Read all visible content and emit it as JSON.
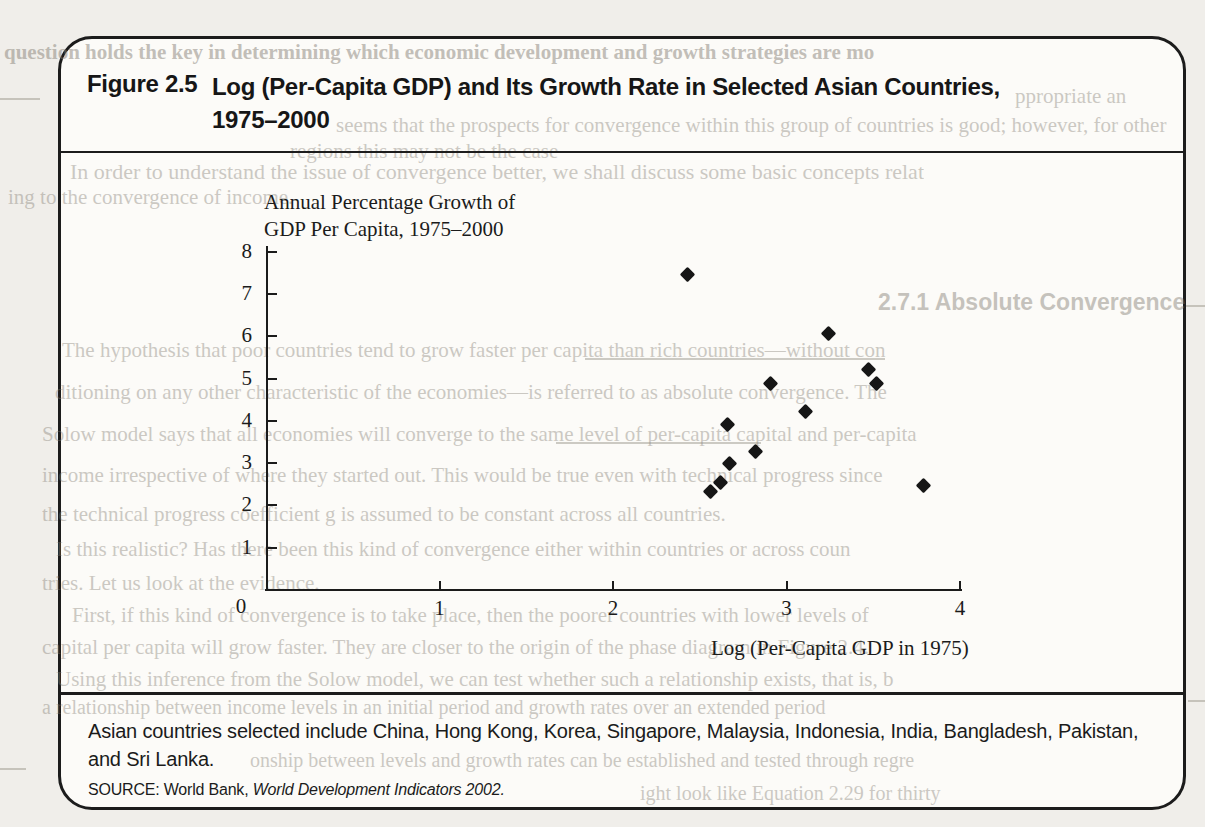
{
  "figure": {
    "label": "Figure 2.5",
    "title_line1": "Log (Per-Capita GDP) and Its Growth Rate in Selected Asian Countries,",
    "title_line2": "1975–2000",
    "caption_line1": "Asian countries selected include China, Hong Kong, Korea, Singapore, Malaysia, Indonesia, India, Bangladesh, Pakistan,",
    "caption_line2": "and Sri Lanka.",
    "source_prefix": "SOURCE: World Bank, ",
    "source_italic": "World Development Indicators 2002."
  },
  "chart_data": {
    "type": "scatter",
    "ylabel_line1": "Annual Percentage Growth of",
    "ylabel_line2": "GDP Per Capita, 1975–2000",
    "xlabel": "Log (Per-Capita GDP in 1975)",
    "xlim": [
      0,
      4
    ],
    "ylim": [
      0,
      8
    ],
    "x_ticks": [
      1,
      2,
      3,
      4
    ],
    "y_ticks": [
      1,
      2,
      3,
      4,
      5,
      6,
      7,
      8
    ],
    "origin_label": "0",
    "grid": false,
    "marker": "diamond",
    "marker_color": "#161616",
    "points": [
      {
        "x": 2.43,
        "y": 7.46
      },
      {
        "x": 3.24,
        "y": 6.07
      },
      {
        "x": 3.47,
        "y": 5.22
      },
      {
        "x": 3.52,
        "y": 4.87
      },
      {
        "x": 2.91,
        "y": 4.89
      },
      {
        "x": 3.11,
        "y": 4.23
      },
      {
        "x": 2.66,
        "y": 3.92
      },
      {
        "x": 2.82,
        "y": 3.27
      },
      {
        "x": 2.67,
        "y": 3.0
      },
      {
        "x": 2.62,
        "y": 2.55
      },
      {
        "x": 2.56,
        "y": 2.34
      },
      {
        "x": 3.79,
        "y": 2.46
      }
    ]
  },
  "bleedthrough": {
    "lines": [
      {
        "cls": "serif-b",
        "x": 4,
        "y": 40,
        "size": 21,
        "text": "question holds the key in determining which economic development and growth strategies are mo"
      },
      {
        "cls": "serif",
        "x": 1015,
        "y": 84,
        "size": 21,
        "text": "ppropriate an"
      },
      {
        "cls": "serif",
        "x": 336,
        "y": 113,
        "size": 21,
        "text": "seems that the prospects for convergence within this group of countries is good; however, for other"
      },
      {
        "cls": "serif",
        "x": 290,
        "y": 139,
        "size": 21,
        "text": "regions this may not be the case"
      },
      {
        "cls": "serif",
        "x": 70,
        "y": 159,
        "size": 22,
        "text": "In order to understand the issue of convergence better, we shall discuss some basic concepts relat"
      },
      {
        "cls": "serif",
        "x": 8,
        "y": 185,
        "size": 21,
        "text": "ing to the convergence of income."
      },
      {
        "cls": "sans-b",
        "x": 878,
        "y": 289,
        "size": 23,
        "text": "2.7.1   Absolute Convergence"
      },
      {
        "cls": "serif",
        "x": 62,
        "y": 338,
        "size": 21,
        "text": "The hypothesis that poor countries tend to grow faster per capita than rich countries—without con"
      },
      {
        "cls": "serif",
        "x": 55,
        "y": 380,
        "size": 21,
        "text": "ditioning on any other characteristic of the economies—is referred to as absolute convergence. The"
      },
      {
        "cls": "serif",
        "x": 42,
        "y": 422,
        "size": 21,
        "text": "Solow model says that all economies will converge to the same level of per-capita capital and per-capita"
      },
      {
        "cls": "serif",
        "x": 42,
        "y": 463,
        "size": 21,
        "text": "income irrespective of where they started out. This would be true even with technical progress since"
      },
      {
        "cls": "serif",
        "x": 42,
        "y": 502,
        "size": 21,
        "text": "the technical progress coefficient g is assumed to be constant across all countries."
      },
      {
        "cls": "serif",
        "x": 56,
        "y": 537,
        "size": 21,
        "text": "Is this realistic? Has there been this kind of convergence either within countries or across coun"
      },
      {
        "cls": "serif",
        "x": 42,
        "y": 571,
        "size": 21,
        "text": "tries. Let us look at the evidence."
      },
      {
        "cls": "serif",
        "x": 72,
        "y": 603,
        "size": 21,
        "text": "First, if this kind of convergence is to take place, then the poorer countries with lower levels of"
      },
      {
        "cls": "serif",
        "x": 42,
        "y": 635,
        "size": 21,
        "text": "capital per capita will grow faster. They are closer to the origin of the phase diagram in Figure 2.4."
      },
      {
        "cls": "serif",
        "x": 56,
        "y": 667,
        "size": 21,
        "text": "Using this inference from the Solow model, we can test whether such a relationship exists, that is, b"
      },
      {
        "cls": "serif",
        "x": 42,
        "y": 696,
        "size": 20,
        "text": "a relationship between income levels in an initial period and growth rates over an extended period"
      },
      {
        "cls": "serif",
        "x": 250,
        "y": 749,
        "size": 20,
        "text": "onship between levels and growth rates can be established and tested through regre"
      },
      {
        "cls": "serif",
        "x": 640,
        "y": 782,
        "size": 20,
        "text": "ight look like Equation 2.29 for thirty"
      }
    ],
    "rules": [
      {
        "x": 585,
        "y": 358,
        "w": 300
      },
      {
        "x": 556,
        "y": 442,
        "w": 205
      },
      {
        "x": 0,
        "y": 98,
        "w": 40
      },
      {
        "x": 1186,
        "y": 305,
        "w": 19
      },
      {
        "x": 1188,
        "y": 700,
        "w": 17
      },
      {
        "x": 0,
        "y": 768,
        "w": 26
      }
    ]
  }
}
